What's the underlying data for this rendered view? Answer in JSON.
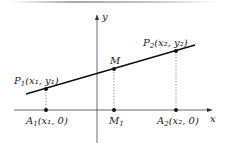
{
  "diagram": {
    "axes": {
      "x_label": "x",
      "y_label": "y"
    },
    "points": {
      "P1": {
        "name": "P",
        "sub": "1",
        "coords": "(x₁, y₁)"
      },
      "P2": {
        "name": "P",
        "sub": "2",
        "coords": "(x₂, y₂)"
      },
      "M": {
        "name": "M"
      },
      "A1": {
        "name": "A",
        "sub": "1",
        "coords": "(x₁, 0)"
      },
      "M1": {
        "name": "M",
        "sub": "1"
      },
      "A2": {
        "name": "A",
        "sub": "2",
        "coords": "(x₂, 0)"
      }
    },
    "colors": {
      "line": "#111111",
      "axis": "#444444",
      "dash": "#555555",
      "top_rule": "#b0b0b0"
    }
  }
}
